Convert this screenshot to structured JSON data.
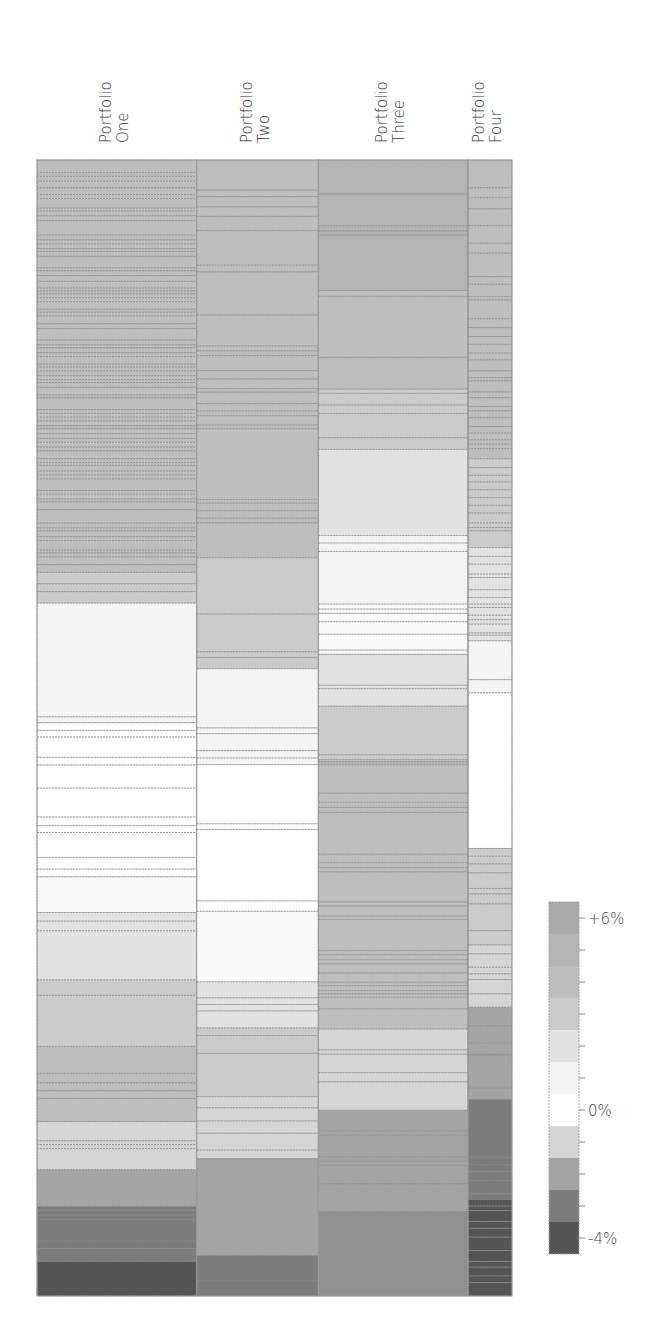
{
  "chart_data": {
    "type": "heatmap",
    "title": "",
    "columns": [
      {
        "name": "Portfolio One",
        "label_lines": [
          "Portfolio",
          "One"
        ],
        "relative_width": 160,
        "segments": [
          {
            "value": 4,
            "weights": [
              13,
              4,
              5,
              7,
              7,
              4,
              10,
              3,
              5,
              5,
              15,
              5,
              4,
              5,
              3,
              5,
              12,
              3,
              5,
              6,
              7,
              3,
              3,
              4,
              4,
              8,
              3,
              4,
              8,
              5,
              12,
              5,
              3,
              5,
              4,
              8,
              3,
              4,
              5,
              4,
              3,
              5,
              8,
              3,
              12,
              4,
              4,
              4,
              5,
              3,
              5,
              5,
              4,
              5,
              4,
              8,
              4,
              3,
              6,
              4,
              4,
              12,
              4,
              5,
              3,
              8,
              14,
              5,
              3,
              6,
              4,
              10,
              3,
              4,
              8,
              8
            ]
          },
          {
            "value": 3,
            "weights": [
              12,
              8,
              12
            ]
          },
          {
            "value": 1,
            "weights": [
              118,
              6
            ]
          },
          {
            "value": 0,
            "weights": [
              8,
              7,
              21,
              8,
              24,
              30,
              9,
              7,
              26,
              12,
              8
            ]
          },
          {
            "value": 0.5,
            "weights": [
              37
            ]
          },
          {
            "value": 2,
            "weights": [
              9,
              10,
              51
            ]
          },
          {
            "value": 3,
            "weights": [
              16,
              53
            ]
          },
          {
            "value": 4,
            "weights": [
              28,
              10,
              8,
              8,
              24
            ]
          },
          {
            "value": -1,
            "weights": [
              20,
              4,
              4,
              22
            ]
          },
          {
            "value": -2,
            "weights": [
              38
            ]
          },
          {
            "value": -3,
            "weights": [
              4,
              5,
              5,
              22,
              8,
              13
            ]
          },
          {
            "value": -4,
            "weights": [
              36
            ]
          }
        ]
      },
      {
        "name": "Portfolio Two",
        "label_lines": [
          "Portfolio",
          "Two"
        ],
        "relative_width": 122,
        "segments": [
          {
            "value": 4,
            "weights": [
              32,
              7,
              11,
              10,
              15,
              37,
              7,
              46,
              33,
              5,
              5,
              16,
              9,
              10,
              4,
              12,
              8,
              5,
              10,
              4,
              75,
              4,
              8,
              8,
              5,
              37
            ]
          },
          {
            "value": 3,
            "weights": [
              60,
              40,
              6,
              12
            ]
          },
          {
            "value": 1,
            "weights": [
              63,
              6,
              18,
              8,
              7
            ]
          },
          {
            "value": 0,
            "weights": [
              63,
              6,
              76,
              11
            ]
          },
          {
            "value": 0.5,
            "weights": [
              75
            ]
          },
          {
            "value": 2,
            "weights": [
              17,
              7,
              7,
              18
            ]
          },
          {
            "value": 3,
            "weights": [
              8,
              19,
              46
            ]
          },
          {
            "value": -1,
            "weights": [
              12,
              14,
              13,
              18,
              9
            ]
          },
          {
            "value": -2,
            "weights": [
              103
            ]
          },
          {
            "value": -3,
            "weights": [
              27,
              16
            ]
          }
        ]
      },
      {
        "name": "Portfolio Three",
        "label_lines": [
          "Portfolio",
          "Three"
        ],
        "relative_width": 150,
        "segments": [
          {
            "value": 5,
            "weights": [
              41,
              38,
              6,
              5,
              66
            ]
          },
          {
            "value": 4,
            "weights": [
              7,
              73,
              38
            ]
          },
          {
            "value": 3,
            "weights": [
              5,
              14,
              10,
              29,
              14
            ]
          },
          {
            "value": 2,
            "weights": [
              103
            ]
          },
          {
            "value": 1,
            "weights": [
              9,
              10,
              63
            ]
          },
          {
            "value": 0.5,
            "weights": [
              6,
              5,
              10,
              15,
              19,
              5
            ]
          },
          {
            "value": 2,
            "weights": [
              37,
              4,
              21
            ]
          },
          {
            "value": 3,
            "weights": [
              58,
              6,
              2,
              2,
              2
            ]
          },
          {
            "value": 4,
            "weights": [
              34,
              11,
              6,
              6,
              50,
              10,
              6,
              5,
              36,
              5,
              12,
              4,
              37,
              5,
              6,
              5,
              11,
              11,
              4,
              6,
              4,
              4,
              14,
              24
            ]
          },
          {
            "value": -1,
            "weights": [
              25,
              5,
              22,
              11,
              34
            ]
          },
          {
            "value": -2,
            "weights": [
              25,
              5,
              26,
              5,
              5,
              22,
              33
            ]
          },
          {
            "value": -2.5,
            "weights": [
              88,
              13
            ]
          }
        ]
      },
      {
        "name": "Portfolio Four",
        "label_lines": [
          "Portfolio",
          "Four"
        ],
        "relative_width": 44,
        "segments": [
          {
            "value": 4,
            "weights": [
              25,
              9,
              10,
              15,
              16,
              9,
              21,
              7,
              11,
              3,
              17,
              8,
              8,
              7,
              8,
              6,
              10,
              6,
              3,
              10,
              5,
              8,
              4,
              6,
              8,
              6,
              6,
              4,
              4,
              9
            ]
          },
          {
            "value": 3,
            "weights": [
              8,
              7,
              6,
              7,
              7,
              7,
              7,
              9,
              4,
              3,
              15
            ]
          },
          {
            "value": 2,
            "weights": [
              8,
              7,
              9,
              3,
              11,
              7,
              6,
              3,
              7,
              4,
              4,
              8,
              2,
              5
            ]
          },
          {
            "value": 1,
            "weights": [
              35,
              12
            ]
          },
          {
            "value": 0,
            "weights": [
              140
            ]
          },
          {
            "value": 3,
            "weights": [
              7,
              7,
              8,
              14,
              5,
              9,
              24,
              13
            ]
          },
          {
            "value": -1,
            "weights": [
              8,
              12,
              6,
              5,
              13,
              12
            ]
          },
          {
            "value": -2,
            "weights": [
              17,
              15,
              11,
              30,
              10
            ]
          },
          {
            "value": -3,
            "weights": [
              52,
              7,
              6,
              8,
              12,
              5
            ]
          },
          {
            "value": -4,
            "weights": [
              6,
              4,
              10,
              6,
              8,
              12,
              10,
              5,
              8,
              6,
              12
            ]
          }
        ]
      }
    ],
    "legend": {
      "title": "",
      "min": -4,
      "max": 6,
      "step": 1,
      "levels": [
        {
          "value": 6,
          "color": "#a9a9a9"
        },
        {
          "value": 5,
          "color": "#b4b4b4"
        },
        {
          "value": 4,
          "color": "#bebebe"
        },
        {
          "value": 3,
          "color": "#cbcbcb"
        },
        {
          "value": 2,
          "color": "#e2e2e2"
        },
        {
          "value": 1,
          "color": "#f4f4f4"
        },
        {
          "value": 0,
          "color": "#ffffff"
        },
        {
          "value": -1,
          "color": "#d5d5d5"
        },
        {
          "value": -2,
          "color": "#a4a4a4"
        },
        {
          "value": -3,
          "color": "#7c7c7c"
        },
        {
          "value": -4,
          "color": "#555555"
        }
      ],
      "tick_labels": [
        {
          "value": 6,
          "text": "+6%"
        },
        {
          "value": 0,
          "text": "0%"
        },
        {
          "value": -4,
          "text": "-4%"
        }
      ]
    },
    "stripe_border_color": "#8a8a8a"
  }
}
